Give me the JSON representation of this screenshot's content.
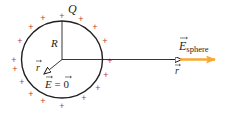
{
  "figure": {
    "width": 227,
    "height": 115,
    "background": "#ffffff",
    "colors": {
      "line": "#231f20",
      "plus_charge": "#b5474b",
      "field_arrow": "#f7a833",
      "label": "#231f20"
    },
    "sphere": {
      "cx": 62,
      "cy": 59.5,
      "rx": 40.5,
      "ry": 38.5,
      "label_charge": "Q",
      "label_radius": "R"
    },
    "plus_sign": "+",
    "charges": [
      {
        "x": 62,
        "y": 16
      },
      {
        "x": 81,
        "y": 19
      },
      {
        "x": 95,
        "y": 27
      },
      {
        "x": 105,
        "y": 41
      },
      {
        "x": 110,
        "y": 61
      },
      {
        "x": 106,
        "y": 75
      },
      {
        "x": 98,
        "y": 88
      },
      {
        "x": 84,
        "y": 98
      },
      {
        "x": 62,
        "y": 106
      },
      {
        "x": 43,
        "y": 101
      },
      {
        "x": 31,
        "y": 94
      },
      {
        "x": 22,
        "y": 82
      },
      {
        "x": 15,
        "y": 69
      },
      {
        "x": 14,
        "y": 60
      },
      {
        "x": 20,
        "y": 41
      },
      {
        "x": 31,
        "y": 27
      },
      {
        "x": 43,
        "y": 18
      }
    ],
    "inside": {
      "r_label": "r",
      "field_label_lhs": "E",
      "field_label_eq": " = ",
      "field_label_rhs": "0"
    },
    "outside": {
      "r_label": "r",
      "field_label": "E",
      "field_subscript": "sphere"
    }
  }
}
